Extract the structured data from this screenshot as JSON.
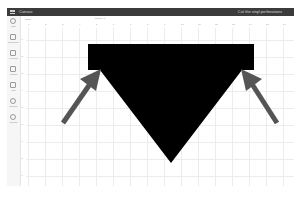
{
  "titlebar": {
    "title": "Canvas",
    "project_name": "Cut the vinyl perforations"
  },
  "sidebar": {
    "items": [
      {
        "label": "New",
        "icon": "plus-icon"
      },
      {
        "label": "Templates",
        "icon": "shirt-icon"
      },
      {
        "label": "Projects",
        "icon": "grid-icon"
      },
      {
        "label": "Images",
        "icon": "image-icon"
      },
      {
        "label": "Text",
        "icon": "text-icon"
      },
      {
        "label": "Shapes",
        "icon": "shapes-icon"
      },
      {
        "label": "Upload",
        "icon": "upload-icon"
      }
    ]
  },
  "toolbar": {
    "undo_label": "Undo",
    "center_label": "Select All"
  },
  "ruler": {
    "top_ticks": [
      "1",
      "2",
      "3",
      "4",
      "5",
      "6",
      "7",
      "8",
      "9",
      "10",
      "11",
      "12",
      "13",
      "14",
      "15",
      "16"
    ],
    "left_ticks": [
      "1",
      "2",
      "3",
      "4",
      "5",
      "6",
      "7",
      "8",
      "9"
    ]
  },
  "canvas": {
    "shape": {
      "name": "inverted-triangle-with-bar",
      "fill": "#000000",
      "points": [
        [
          88,
          44
        ],
        [
          254,
          44
        ],
        [
          254,
          70
        ],
        [
          242,
          70
        ],
        [
          171,
          163
        ],
        [
          100,
          70
        ],
        [
          88,
          70
        ]
      ]
    },
    "arrows": [
      {
        "name": "arrow-left",
        "color": "#555555",
        "from": [
          62,
          123
        ],
        "to": [
          100,
          70
        ]
      },
      {
        "name": "arrow-right",
        "color": "#555555",
        "from": [
          278,
          123
        ],
        "to": [
          242,
          70
        ]
      }
    ]
  }
}
